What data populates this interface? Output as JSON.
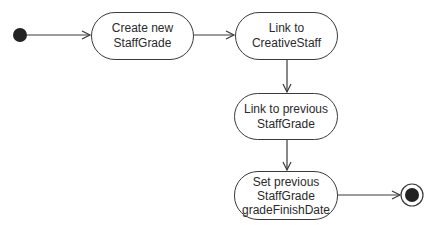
{
  "diagram": {
    "type": "UML activity diagram",
    "initial_node": {
      "cx": 20,
      "cy": 35,
      "r": 7
    },
    "final_node": {
      "cx": 412,
      "cy": 195,
      "outer_r": 11,
      "inner_r": 7
    },
    "activities": [
      {
        "id": "a1",
        "label": "Create new\nStaffGrade",
        "x": 91,
        "y": 12,
        "w": 103,
        "h": 48
      },
      {
        "id": "a2",
        "label": "Link to\nCreativeStaff",
        "x": 235,
        "y": 12,
        "w": 103,
        "h": 48
      },
      {
        "id": "a3",
        "label": "Link to previous\nStaffGrade",
        "x": 234,
        "y": 93,
        "w": 104,
        "h": 47
      },
      {
        "id": "a4",
        "label": "Set previous\nStaffGrade\ngradeFinishDate",
        "x": 234,
        "y": 171,
        "w": 104,
        "h": 49
      }
    ],
    "edges": [
      {
        "from": "initial",
        "to": "a1"
      },
      {
        "from": "a1",
        "to": "a2"
      },
      {
        "from": "a2",
        "to": "a3"
      },
      {
        "from": "a3",
        "to": "a4"
      },
      {
        "from": "a4",
        "to": "final"
      }
    ],
    "colors": {
      "stroke": "#3a3a3a",
      "fill": "#ffffff",
      "node": "#222222",
      "text": "#2a2a2a"
    }
  }
}
